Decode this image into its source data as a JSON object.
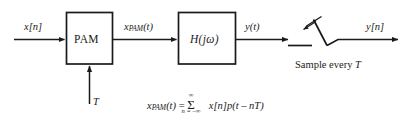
{
  "diagram": {
    "type": "block-diagram",
    "stroke_color": "#1a1a1a",
    "background": "#ffffff",
    "blocks": [
      {
        "id": "pam",
        "label": "PAM"
      },
      {
        "id": "filter",
        "label": "H(jω)"
      }
    ],
    "signals": {
      "input": "x[n]",
      "pam_output_base": "x",
      "pam_output_sub": "PAM",
      "pam_output_arg": "(t)",
      "filter_output": "y(t)",
      "sampled_output": "y[n]",
      "clock": "T"
    },
    "annotations": {
      "sampler_caption_text": "Sample every ",
      "sampler_caption_symbol": "T"
    },
    "equation": {
      "lhs_base": "x",
      "lhs_sub": "PAM",
      "lhs_arg": "(t)",
      "equals": " = ",
      "sigma": "Σ",
      "sum_upper": "∞",
      "sum_lower": "n = –∞",
      "rhs": "x[n]p(t – nT)"
    }
  }
}
